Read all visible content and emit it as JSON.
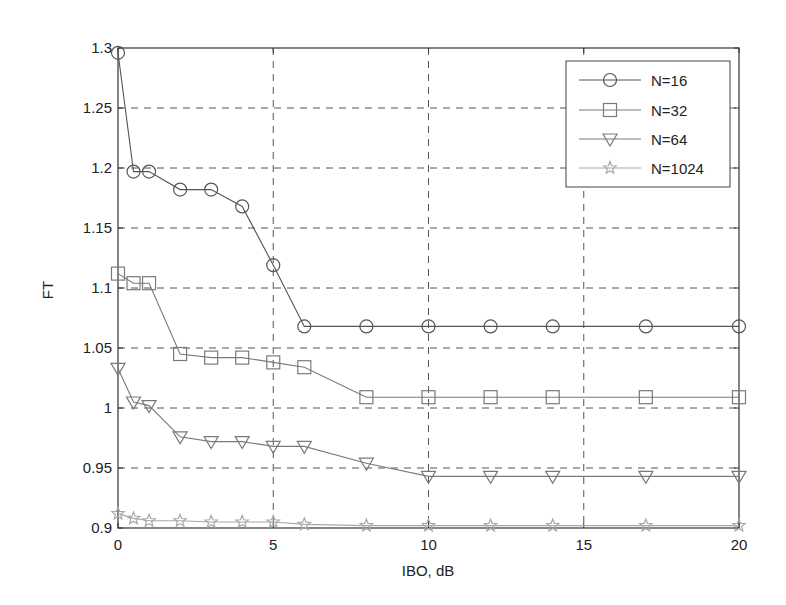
{
  "chart_data": {
    "type": "line",
    "title": "",
    "xlabel": "IBO, dB",
    "ylabel": "FT",
    "xlim": [
      0,
      20
    ],
    "ylim": [
      0.9,
      1.3
    ],
    "xticks": [
      0,
      5,
      10,
      15,
      20
    ],
    "xtick_labels": [
      "0",
      "5",
      "10",
      "15",
      "20"
    ],
    "yticks": [
      0.9,
      0.95,
      1.0,
      1.05,
      1.1,
      1.15,
      1.2,
      1.25,
      1.3
    ],
    "ytick_labels": [
      "0.9",
      "0.95",
      "1",
      "1.05",
      "1.1",
      "1.15",
      "1.2",
      "1.25",
      "1.3"
    ],
    "grid": true,
    "legend_position": "upper right",
    "x": [
      0,
      0.5,
      1,
      2,
      3,
      4,
      5,
      6,
      8,
      10,
      12,
      14,
      17,
      20
    ],
    "series": [
      {
        "name": "N=16",
        "marker": "circle",
        "color": "#555555",
        "values": [
          1.296,
          1.197,
          1.197,
          1.182,
          1.182,
          1.168,
          1.119,
          1.068,
          1.068,
          1.068,
          1.068,
          1.068,
          1.068,
          1.068
        ]
      },
      {
        "name": "N=32",
        "marker": "square",
        "color": "#7a7a7a",
        "values": [
          1.112,
          1.104,
          1.104,
          1.045,
          1.042,
          1.042,
          1.038,
          1.034,
          1.009,
          1.009,
          1.009,
          1.009,
          1.009,
          1.009
        ]
      },
      {
        "name": "N=64",
        "marker": "triangle-down",
        "color": "#7a7a7a",
        "values": [
          1.033,
          1.005,
          1.002,
          0.976,
          0.972,
          0.972,
          0.968,
          0.968,
          0.954,
          0.943,
          0.943,
          0.943,
          0.943,
          0.943
        ]
      },
      {
        "name": "N=1024",
        "marker": "star",
        "color": "#a8a8a8",
        "values": [
          0.912,
          0.908,
          0.906,
          0.906,
          0.905,
          0.905,
          0.905,
          0.903,
          0.902,
          0.902,
          0.902,
          0.902,
          0.902,
          0.902
        ]
      }
    ]
  },
  "legend": {
    "items": [
      {
        "label": "N=16"
      },
      {
        "label": "N=32"
      },
      {
        "label": "N=64"
      },
      {
        "label": "N=1024"
      }
    ]
  },
  "axes": {
    "xlabel": "IBO, dB",
    "ylabel": "FT"
  }
}
